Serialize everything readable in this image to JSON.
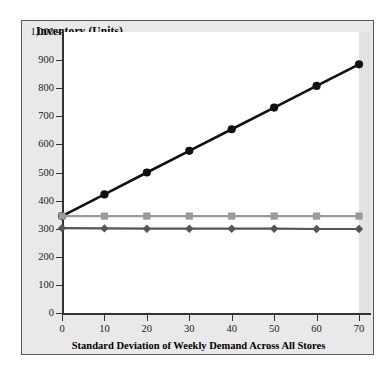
{
  "chart_data": {
    "type": "line",
    "title": "Inventory (Units)",
    "xlabel": "Standard Deviation of Weekly Demand Across All Stores",
    "ylabel": "Inventory (Units)",
    "x": [
      0,
      10,
      20,
      30,
      40,
      50,
      60,
      70
    ],
    "xlim": [
      0,
      70
    ],
    "ylim": [
      0,
      1000
    ],
    "xticks": [
      0,
      10,
      20,
      30,
      40,
      50,
      60,
      70
    ],
    "xtick_labels": [
      "0",
      "10",
      "20",
      "30",
      "40",
      "50",
      "60",
      "70"
    ],
    "yticks": [
      0,
      100,
      200,
      300,
      400,
      500,
      600,
      700,
      800,
      900,
      1000
    ],
    "ytick_labels": [
      "0",
      "100",
      "200",
      "300",
      "400",
      "500",
      "600",
      "700",
      "800",
      "900",
      "1,000"
    ],
    "grid": false,
    "legend": "none",
    "series": [
      {
        "name": "rising-inventory",
        "marker": "circle",
        "color": "#111111",
        "values": [
          345,
          422,
          500,
          577,
          654,
          731,
          808,
          885
        ]
      },
      {
        "name": "flat-upper-inventory",
        "marker": "square",
        "color": "#9a9a9a",
        "values": [
          345,
          345,
          345,
          345,
          345,
          345,
          345,
          345
        ]
      },
      {
        "name": "flat-lower-inventory",
        "marker": "diamond",
        "color": "#555555",
        "values": [
          302,
          301,
          300,
          300,
          300,
          300,
          299,
          299
        ]
      }
    ]
  },
  "colors": {
    "frame_border": "#5a5a5a",
    "frame_background": "#e9e9e9",
    "plot_background": "#ffffff",
    "axis": "#333333",
    "text": "#000000"
  }
}
